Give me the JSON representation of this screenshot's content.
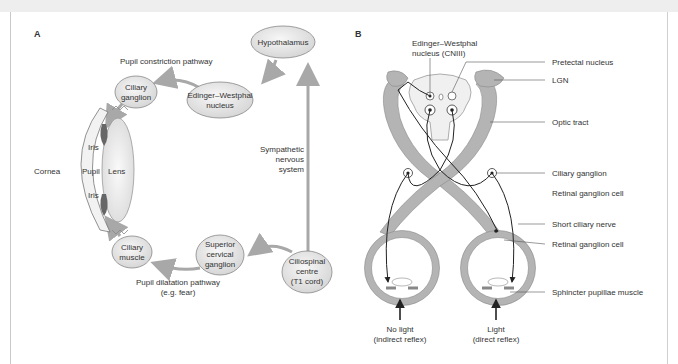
{
  "panel_a": {
    "label": "A",
    "nodes": {
      "hypothalamus": "Hypothalamus",
      "edinger_1": "Edinger–Westphal",
      "edinger_2": "nucleus",
      "ciliary_ganglion_1": "Ciliary",
      "ciliary_ganglion_2": "ganglion",
      "ciliary_muscle_1": "Ciliary",
      "ciliary_muscle_2": "muscle",
      "superior_1": "Superior",
      "superior_2": "cervical",
      "superior_3": "ganglion",
      "ciliospinal_1": "Ciliospinal",
      "ciliospinal_2": "centre",
      "ciliospinal_3": "(T1 cord)"
    },
    "labels": {
      "constriction": "Pupil constriction pathway",
      "sympathetic_1": "Sympathetic",
      "sympathetic_2": "nervous",
      "sympathetic_3": "system",
      "dilatation_1": "Pupil dilatation pathway",
      "dilatation_2": "(e.g. fear)",
      "cornea": "Cornea",
      "pupil": "Pupil",
      "lens": "Lens",
      "iris_top": "Iris",
      "iris_bottom": "Iris"
    }
  },
  "panel_b": {
    "label": "B",
    "labels": {
      "edinger_1": "Edinger–Westphal",
      "edinger_2": "nucleus (CNIII)",
      "pretectal": "Pretectal nucleus",
      "lgn": "LGN",
      "optic_tract": "Optic tract",
      "ciliary_ganglion": "Ciliary ganglion",
      "retinal_ganglion_1": "Retinal ganglion cell",
      "short_ciliary": "Short ciliary nerve",
      "retinal_ganglion_2": "Retinal ganglion cell",
      "sphincter": "Sphincter pupillae muscle",
      "no_light_1": "No light",
      "no_light_2": "(indirect reflex)",
      "light_1": "Light",
      "light_2": "(direct reflex)"
    }
  },
  "colors": {
    "node_fill": "#e6e6e6",
    "arrow": "#a8a8a8",
    "tract": "#b4b4b4",
    "line": "#222222"
  }
}
